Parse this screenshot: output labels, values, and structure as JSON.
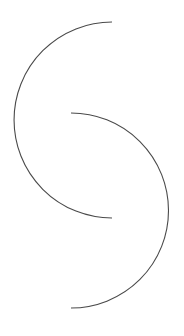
{
  "canvas": {
    "width": 184,
    "height": 336,
    "background": "#ffffff"
  },
  "stroke": {
    "color": "#4a4a4a",
    "width": 1.1
  },
  "shapes": [
    {
      "name": "upper-arc",
      "start": [
        112,
        22
      ],
      "end": [
        112,
        218
      ],
      "radius": 97,
      "bulge": "left"
    },
    {
      "name": "lower-arc",
      "start": [
        71,
        113
      ],
      "end": [
        71,
        308
      ],
      "radius": 97,
      "bulge": "right"
    }
  ]
}
